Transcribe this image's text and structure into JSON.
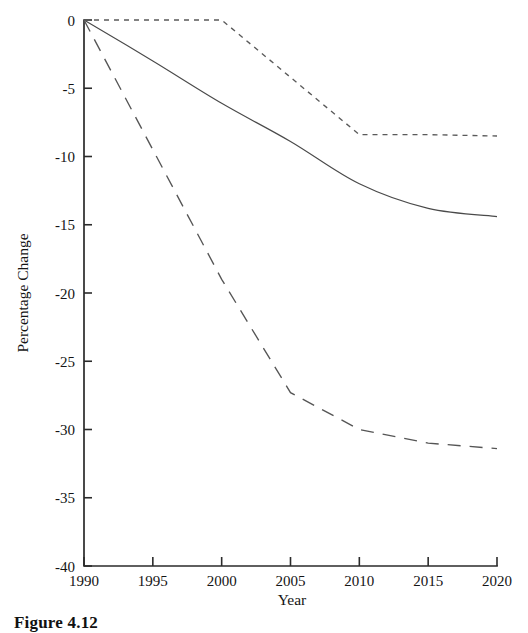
{
  "caption": {
    "text": "Figure 4.12"
  },
  "chart_data": {
    "type": "line",
    "title": "",
    "xlabel": "Year",
    "ylabel": "Percentage Change",
    "xlim": [
      1990,
      2020
    ],
    "ylim": [
      -40,
      0
    ],
    "grid": false,
    "legend": "none",
    "x": [
      1990,
      1995,
      2000,
      2005,
      2010,
      2015,
      2020
    ],
    "xticks": [
      "1990",
      "1995",
      "2000",
      "2005",
      "2010",
      "2015",
      "2020"
    ],
    "yticks": [
      "0",
      "-5",
      "-10",
      "-15",
      "-20",
      "-25",
      "-30",
      "-35",
      "-40"
    ],
    "ytick_values": [
      0,
      -5,
      -10,
      -15,
      -20,
      -25,
      -30,
      -35,
      -40
    ],
    "series": [
      {
        "name": "solid-line",
        "style": "solid",
        "color": "#4a4a4a",
        "values": [
          0,
          -3.0,
          -6.1,
          -8.9,
          -12.0,
          -13.8,
          -14.4
        ]
      },
      {
        "name": "long-dashed-line",
        "style": "dashed",
        "color": "#555555",
        "values": [
          0,
          -9.5,
          -19.0,
          -27.3,
          -30.0,
          -31.0,
          -31.4
        ]
      },
      {
        "name": "dotted-line",
        "style": "dotted",
        "color": "#5a5a5a",
        "values": [
          0,
          0,
          0,
          -4.2,
          -8.4,
          -8.4,
          -8.5
        ]
      }
    ]
  }
}
